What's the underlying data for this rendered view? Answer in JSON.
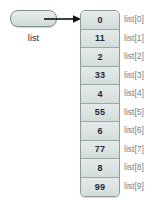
{
  "diagram": {
    "pointer": {
      "label": "list",
      "box_fill": "#dbe4e2",
      "box_border": "#7e8f8d"
    },
    "arrow": {
      "name": "reference-arrow",
      "color": "#111111"
    },
    "array": {
      "fill": "#dce4e2",
      "border": "#8d9c9a",
      "divider": "#9aa8a6",
      "value_color": "#1b2a3a",
      "label_color": "#6e8490",
      "cells": [
        {
          "value": "0",
          "label": "list[0]"
        },
        {
          "value": "11",
          "label": "list[1]"
        },
        {
          "value": "2",
          "label": "list[2]"
        },
        {
          "value": "33",
          "label": "list[3]"
        },
        {
          "value": "4",
          "label": "list[4]"
        },
        {
          "value": "55",
          "label": "list[5]"
        },
        {
          "value": "6",
          "label": "list[6]"
        },
        {
          "value": "77",
          "label": "list[7]"
        },
        {
          "value": "8",
          "label": "list[8]"
        },
        {
          "value": "99",
          "label": "list[9]"
        }
      ]
    }
  }
}
